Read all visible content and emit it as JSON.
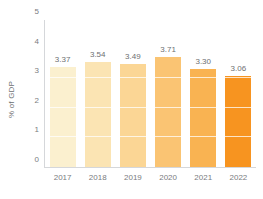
{
  "chart_data": {
    "type": "bar",
    "title": "",
    "subtitle": "",
    "xlabel": "",
    "ylabel": "% of GDP",
    "categories": [
      "2017",
      "2018",
      "2019",
      "2020",
      "2021",
      "2022"
    ],
    "values": [
      3.37,
      3.54,
      3.49,
      3.71,
      3.3,
      3.06
    ],
    "data_labels": [
      "3.37",
      "3.54",
      "3.49",
      "3.71",
      "3.30",
      "3.06"
    ],
    "ylim": [
      0,
      5
    ],
    "yticks": [
      0,
      1,
      2,
      3,
      4,
      5
    ],
    "ytick_labels": [
      "0",
      "1",
      "2",
      "3",
      "4",
      "5"
    ],
    "grid": "horizontal-white-over-bars",
    "legend": "none",
    "bar_colors": [
      "#fbf0cf",
      "#fbe4b3",
      "#fbd695",
      "#fac473",
      "#f9b352",
      "#f79420"
    ],
    "axis_color": "#d5d7da",
    "label_color": "#6d6f72",
    "tick_color": "#7a7c80"
  }
}
